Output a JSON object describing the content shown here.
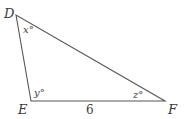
{
  "diagram": {
    "type": "triangle",
    "vertices": [
      {
        "name": "D",
        "x": 16,
        "y": 15,
        "label": "D"
      },
      {
        "name": "E",
        "x": 31,
        "y": 101,
        "label": "E"
      },
      {
        "name": "F",
        "x": 165,
        "y": 101,
        "label": "F"
      }
    ],
    "angles": [
      {
        "vertex": "D",
        "label": "x°"
      },
      {
        "vertex": "E",
        "label": "y°"
      },
      {
        "vertex": "F",
        "label": "z°"
      }
    ],
    "sides": [
      {
        "from": "E",
        "to": "F",
        "label": "6"
      }
    ],
    "stroke_color": "#555555"
  }
}
